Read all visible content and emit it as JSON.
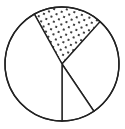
{
  "chart_data": {
    "type": "pie",
    "title": "",
    "slices": [
      {
        "label": "dotted",
        "start_deg": 331,
        "end_deg": 42,
        "percent": 20,
        "fill": "dotted"
      },
      {
        "label": "slice-b",
        "start_deg": 42,
        "end_deg": 146,
        "percent": 29,
        "fill": "white"
      },
      {
        "label": "slice-c",
        "start_deg": 146,
        "end_deg": 180,
        "percent": 9,
        "fill": "white"
      },
      {
        "label": "slice-d",
        "start_deg": 180,
        "end_deg": 331,
        "percent": 42,
        "fill": "white"
      }
    ],
    "center": [
      62,
      64
    ],
    "radius": 57,
    "stroke_color": "#222222",
    "background": "#ffffff"
  }
}
